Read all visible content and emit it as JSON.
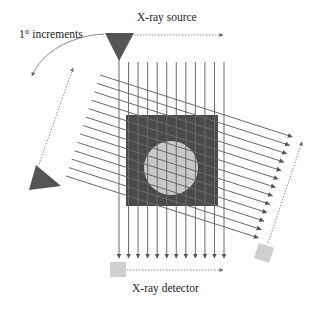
{
  "labels": {
    "source": "X-ray source",
    "detector": "X-ray detector",
    "rotation": "1° increments"
  },
  "diagram": {
    "parallel_beam_count_vertical": 12,
    "parallel_beam_count_rotated": 13,
    "rotation_step_degrees": 1,
    "colors": {
      "object_square": "#4a4a4a",
      "object_circle": "#c8c8c8",
      "beam_line": "#6a6a6a",
      "source": "#555555",
      "detector": "#cfcfcf",
      "dashed_arrow": "#8a8a8a"
    }
  }
}
